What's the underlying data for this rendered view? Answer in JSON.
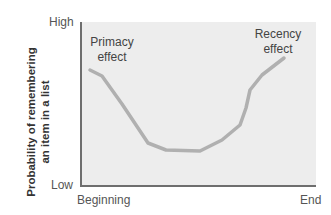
{
  "chart_data": {
    "type": "line",
    "title": "",
    "xlabel": "",
    "ylabel": "Probability of remembering an item in a list",
    "ylabel_lines": [
      "Probability of remembering",
      "an item in a list"
    ],
    "x_ticks": [
      "Beginning",
      "End"
    ],
    "y_ticks": [
      "Low",
      "High"
    ],
    "ylim": [
      0,
      1
    ],
    "series": [
      {
        "name": "Serial position curve",
        "color": "#b0b0b0",
        "x": [
          0.04,
          0.09,
          0.17,
          0.29,
          0.36,
          0.51,
          0.6,
          0.68,
          0.7,
          0.72,
          0.77,
          0.87
        ],
        "y": [
          0.71,
          0.67,
          0.5,
          0.26,
          0.22,
          0.21,
          0.28,
          0.37,
          0.48,
          0.59,
          0.68,
          0.78
        ],
        "points_px": [
          [
            90,
            70
          ],
          [
            102,
            76
          ],
          [
            122,
            104
          ],
          [
            148,
            143
          ],
          [
            166,
            150
          ],
          [
            200,
            151
          ],
          [
            222,
            140
          ],
          [
            240,
            125
          ],
          [
            246,
            108
          ],
          [
            250,
            90
          ],
          [
            262,
            75
          ],
          [
            284,
            58
          ]
        ]
      }
    ],
    "annotations": [
      {
        "text_lines": [
          "Primacy",
          "effect"
        ],
        "x": 110,
        "y": 36
      },
      {
        "text_lines": [
          "Recency",
          "effect"
        ],
        "x": 275,
        "y": 28
      }
    ],
    "grid": false,
    "background": "#ededed"
  }
}
